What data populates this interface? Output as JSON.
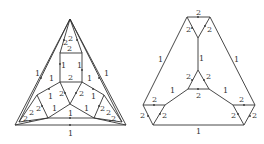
{
  "figure": {
    "left_graph": {
      "name": "triangulated graph with edge weights",
      "edge_labels": [
        {
          "text": "2",
          "x": 66,
          "y": 43
        },
        {
          "text": "2",
          "x": 71,
          "y": 41
        },
        {
          "text": "2",
          "x": 69,
          "y": 51
        },
        {
          "text": "1",
          "x": 60,
          "y": 66
        },
        {
          "text": "1",
          "x": 79,
          "y": 66
        },
        {
          "text": "2",
          "x": 70,
          "y": 79
        },
        {
          "text": "1",
          "x": 37,
          "y": 76
        },
        {
          "text": "1",
          "x": 51,
          "y": 81
        },
        {
          "text": "1",
          "x": 89,
          "y": 81
        },
        {
          "text": "1",
          "x": 106,
          "y": 76
        },
        {
          "text": "1",
          "x": 50,
          "y": 98
        },
        {
          "text": "2",
          "x": 61,
          "y": 95
        },
        {
          "text": "2",
          "x": 81,
          "y": 95
        },
        {
          "text": "1",
          "x": 93,
          "y": 98
        },
        {
          "text": "2",
          "x": 38,
          "y": 110
        },
        {
          "text": "2",
          "x": 31,
          "y": 115
        },
        {
          "text": "2",
          "x": 25,
          "y": 120
        },
        {
          "text": "1",
          "x": 54,
          "y": 110
        },
        {
          "text": "1",
          "x": 70,
          "y": 114
        },
        {
          "text": "1",
          "x": 86,
          "y": 110
        },
        {
          "text": "2",
          "x": 102,
          "y": 110
        },
        {
          "text": "2",
          "x": 107,
          "y": 114
        },
        {
          "text": "2",
          "x": 113,
          "y": 120
        },
        {
          "text": "1",
          "x": 70,
          "y": 135
        }
      ]
    },
    "right_graph": {
      "name": "truncated triangle graph with edge weights",
      "edge_labels": [
        {
          "text": "2",
          "x": 198,
          "y": 14
        },
        {
          "text": "2",
          "x": 188,
          "y": 31
        },
        {
          "text": "2",
          "x": 209,
          "y": 31
        },
        {
          "text": "1",
          "x": 160,
          "y": 61
        },
        {
          "text": "1",
          "x": 201,
          "y": 60
        },
        {
          "text": "1",
          "x": 236,
          "y": 61
        },
        {
          "text": "2",
          "x": 188,
          "y": 78
        },
        {
          "text": "2",
          "x": 208,
          "y": 78
        },
        {
          "text": "1",
          "x": 172,
          "y": 92
        },
        {
          "text": "2",
          "x": 198,
          "y": 97
        },
        {
          "text": "1",
          "x": 225,
          "y": 92
        },
        {
          "text": "2",
          "x": 154,
          "y": 102
        },
        {
          "text": "2",
          "x": 241,
          "y": 102
        },
        {
          "text": "2",
          "x": 142,
          "y": 117
        },
        {
          "text": "2",
          "x": 164,
          "y": 117
        },
        {
          "text": "2",
          "x": 233,
          "y": 117
        },
        {
          "text": "2",
          "x": 254,
          "y": 117
        },
        {
          "text": "1",
          "x": 198,
          "y": 133
        }
      ]
    }
  }
}
